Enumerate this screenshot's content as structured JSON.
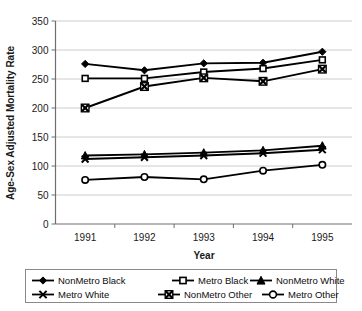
{
  "chart_data": {
    "type": "line",
    "title": "",
    "xlabel": "Year",
    "ylabel": "Age-Sex Adjusted Mortality Rate",
    "categories": [
      "1991",
      "1992",
      "1993",
      "1994",
      "1995"
    ],
    "x": [
      1991,
      1992,
      1993,
      1994,
      1995
    ],
    "ylim": [
      0,
      350
    ],
    "yticks": [
      0,
      50,
      100,
      150,
      200,
      250,
      300,
      350
    ],
    "ytick_labels": [
      "0",
      "50",
      "100",
      "150",
      "200",
      "250",
      "300",
      "350"
    ],
    "grid": true,
    "grid_axis": "y",
    "legend_position": "bottom",
    "series": [
      {
        "name": "NonMetro Black",
        "marker": "filled-diamond",
        "values": [
          276,
          265,
          277,
          278,
          297
        ]
      },
      {
        "name": "Metro Black",
        "marker": "open-square",
        "values": [
          251,
          251,
          262,
          268,
          283
        ]
      },
      {
        "name": "NonMetro White",
        "marker": "filled-triangle",
        "values": [
          118,
          120,
          123,
          127,
          135
        ]
      },
      {
        "name": "Metro White",
        "marker": "cross-x",
        "values": [
          112,
          115,
          118,
          122,
          128
        ]
      },
      {
        "name": "NonMetro Other",
        "marker": "boxed-x",
        "values": [
          200,
          237,
          252,
          246,
          267
        ]
      },
      {
        "name": "Metro Other",
        "marker": "open-circle",
        "values": [
          76,
          81,
          77,
          92,
          102
        ]
      }
    ]
  },
  "legend": {
    "items": [
      {
        "label": "NonMetro Black",
        "marker": "filled-diamond"
      },
      {
        "label": "Metro Black",
        "marker": "open-square"
      },
      {
        "label": "NonMetro White",
        "marker": "filled-triangle"
      },
      {
        "label": "Metro White",
        "marker": "cross-x"
      },
      {
        "label": "NonMetro Other",
        "marker": "boxed-x"
      },
      {
        "label": "Metro Other",
        "marker": "open-circle"
      }
    ]
  },
  "colors": {
    "line": "#000000",
    "grid": "#bfbfbf",
    "axis": "#6e6e6e",
    "background": "#ffffff",
    "text": "#1a1a1a"
  }
}
